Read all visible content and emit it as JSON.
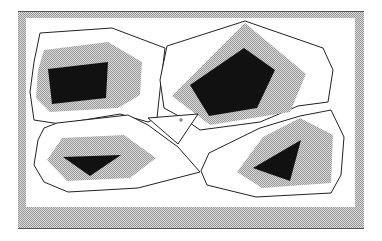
{
  "diagram": {
    "type": "region-partition",
    "colors": {
      "background": "#ffffff",
      "frame_fill": "#c8c8c8",
      "frame_edge": "#555555",
      "halo": "#c4c4c4",
      "obstacle": "#111111",
      "boundary": "#222222"
    },
    "frame": {
      "outer": [
        18,
        11,
        364,
        229
      ],
      "inner": [
        26,
        18,
        355,
        207
      ]
    },
    "regions": [
      {
        "name": "top-left",
        "outline": "40,33 112,28 165,48 160,90 157,118 148,122 120,114 60,124 34,120 30,92 34,62",
        "halo": "44,50 108,42 142,62 140,95 118,108 50,112 36,98 38,70",
        "obstacle": "48,69 108,62 106,98 52,104"
      },
      {
        "name": "top-right",
        "outline": "167,46 245,21 323,48 333,70 328,102 298,106 260,122 200,130 186,120 164,108 160,80",
        "halo": "172,96 245,23 306,74 290,112 210,125",
        "obstacle": "190,85 244,48 275,70 257,108 209,116"
      },
      {
        "name": "bottom-left",
        "outline": "44,128 57,123 128,115 148,125 178,147 200,172 138,188 68,192 44,182 34,165 38,140",
        "halo": "47,160 62,138 124,135 156,158 130,178 67,181",
        "obstacle": "63,157 121,155 90,176"
      },
      {
        "name": "bottom-right",
        "outline": "209,153 260,128 300,116 331,110 344,137 341,175 331,193 256,197 207,185 201,171",
        "halo": "237,172 263,137 300,118 333,135 331,183 262,188",
        "obstacle": "253,168 301,140 290,181"
      }
    ],
    "center_cell": {
      "outline": "148,118 198,114 178,144",
      "marker": {
        "x": 181,
        "y": 120
      }
    }
  }
}
